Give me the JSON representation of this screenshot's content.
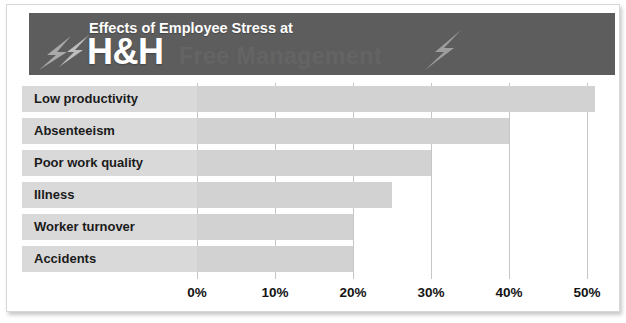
{
  "header": {
    "eyebrow": "Effects of Employee Stress at",
    "brand": "H&H",
    "ghost_text": "Free Management",
    "bolt_left_icon": "lightning-bolt-icon",
    "bolt_right_icon": "lightning-bolt-icon",
    "banner_color": "#5d5d5d",
    "text_color": "#ffffff"
  },
  "chart_data": {
    "type": "bar",
    "orientation": "horizontal",
    "title": "Effects of Employee Stress at H&H",
    "xlabel": "",
    "ylabel": "",
    "categories": [
      "Low productivity",
      "Absenteeism",
      "Poor work quality",
      "Illness",
      "Worker turnover",
      "Accidents"
    ],
    "values": [
      51,
      40,
      30,
      25,
      20,
      20
    ],
    "value_unit": "%",
    "xlim": [
      0,
      50
    ],
    "xticks": [
      0,
      10,
      20,
      30,
      40,
      50
    ],
    "xtick_labels": [
      "0%",
      "10%",
      "20%",
      "30%",
      "40%",
      "50%"
    ],
    "grid": true,
    "grid_axis": "x",
    "legend": false,
    "bar_color": "#d2d2d2",
    "label_band_color": "#d9d9d9",
    "gridline_color": "#c6c6c6"
  }
}
